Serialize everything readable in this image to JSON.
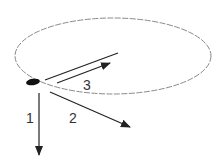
{
  "diagram": {
    "type": "circular-motion-velocity-directions",
    "orbit": {
      "shape": "ellipse",
      "cx": 113,
      "cy": 56,
      "rx": 98,
      "ry": 38,
      "stroke": "#8a8a8a"
    },
    "object": {
      "cx": 33,
      "cy": 82,
      "rx": 7,
      "ry": 3.2,
      "fill": "#111111"
    },
    "tangent_line": {
      "x1": 45,
      "y1": 80,
      "x2": 118,
      "y2": 53
    },
    "arrows": [
      {
        "id": "1",
        "label": "1",
        "x1": 39,
        "y1": 93,
        "x2": 39,
        "y2": 155,
        "label_x": 26,
        "label_y": 123
      },
      {
        "id": "2",
        "label": "2",
        "x1": 50,
        "y1": 92,
        "x2": 130,
        "y2": 127,
        "label_x": 69,
        "label_y": 123
      },
      {
        "id": "3",
        "label": "3",
        "x1": 57,
        "y1": 83,
        "x2": 110,
        "y2": 63,
        "label_x": 83,
        "label_y": 90
      }
    ],
    "colors": {
      "line": "#222222",
      "text": "#333333"
    }
  }
}
